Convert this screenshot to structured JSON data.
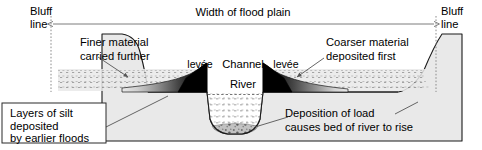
{
  "diagram": {
    "colors": {
      "ground": "#e9e9e9",
      "outline": "#1a1a1a",
      "deposit_dark": "#000000",
      "water": "#ffffff",
      "bed_gravel": "#b9b9b9",
      "leader": "#555555",
      "bluff_guide": "#8c8c8c",
      "background": "#ffffff"
    },
    "labels": {
      "bluff_line_left": {
        "line1": "Bluff",
        "line2": "line"
      },
      "bluff_line_right": {
        "line1": "Bluff",
        "line2": "line"
      },
      "width_of_flood_plain": "Width of flood plain",
      "finer_material": {
        "line1": "Finer material",
        "line2": "carried further"
      },
      "coarser_material": {
        "line1": "Coarser material",
        "line2": "deposited first"
      },
      "levee_left": "levée",
      "levee_right": "levée",
      "channel": "Channel",
      "river": "River",
      "layers_of_silt": {
        "line1": "Layers of silt",
        "line2": "deposited",
        "line3": "by earlier floods"
      },
      "deposition_of_load": {
        "line1": "Deposition of load",
        "line2": "causes bed of river to rise"
      }
    },
    "icons": {
      "span_arrow": "double-headed-arrow-icon",
      "leader_line": "leader-line-icon",
      "bluff_guide": "dotted-vertical-guide-icon"
    }
  }
}
